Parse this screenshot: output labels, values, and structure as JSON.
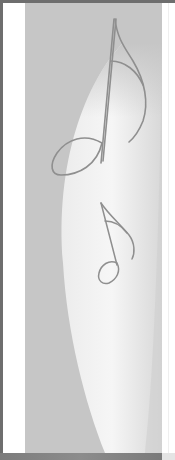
{
  "banner": {
    "description": "Decorative side panel graphic with two music notes over a light crescent",
    "colors": {
      "frame": "#6e6e6e",
      "panel": "#c6c6c6",
      "highlight": "#f2f2f2",
      "note_stroke": "#8f8f8f",
      "bottom_bar": "#828282"
    },
    "icons": [
      "music-note-large-icon",
      "music-note-small-icon"
    ]
  }
}
